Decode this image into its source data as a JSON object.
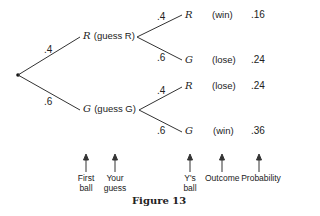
{
  "tree": {
    "root": {
      "label": ""
    },
    "first_level": [
      {
        "prob": ".4",
        "node": "R",
        "guess": "(guess R)"
      },
      {
        "prob": ".6",
        "node": "G",
        "guess": "(guess G)"
      }
    ],
    "leaves": [
      {
        "prob": ".4",
        "ball": "R",
        "outcome": "(win)",
        "probability": ".16"
      },
      {
        "prob": ".6",
        "ball": "G",
        "outcome": "(lose)",
        "probability": ".24"
      },
      {
        "prob": ".4",
        "ball": "R",
        "outcome": "(lose)",
        "probability": ".24"
      },
      {
        "prob": ".6",
        "ball": "G",
        "outcome": "(win)",
        "probability": ".36"
      }
    ]
  },
  "column_labels": [
    {
      "line1": "First",
      "line2": "ball"
    },
    {
      "line1": "Your",
      "line2": "guess"
    },
    {
      "line1": "Y's",
      "line2": "ball"
    },
    {
      "line1": "Outcome",
      "line2": ""
    },
    {
      "line1": "Probability",
      "line2": ""
    }
  ],
  "caption": "Figure 13"
}
